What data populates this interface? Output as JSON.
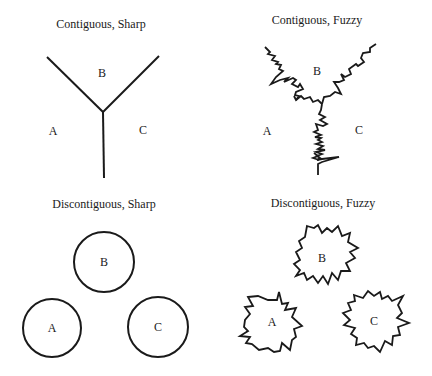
{
  "panels": [
    {
      "id": "contiguous-sharp",
      "title": "Contiguous, Sharp",
      "shape": "sharp Y-shaped boundary lines",
      "regions": [
        {
          "label": "A"
        },
        {
          "label": "B"
        },
        {
          "label": "C"
        }
      ]
    },
    {
      "id": "contiguous-fuzzy",
      "title": "Contiguous, Fuzzy",
      "shape": "jagged Y-shaped boundary lines",
      "regions": [
        {
          "label": "A"
        },
        {
          "label": "B"
        },
        {
          "label": "C"
        }
      ]
    },
    {
      "id": "discontiguous-sharp",
      "title": "Discontiguous, Sharp",
      "shape": "circles",
      "regions": [
        {
          "label": "B"
        },
        {
          "label": "A"
        },
        {
          "label": "C"
        }
      ]
    },
    {
      "id": "discontiguous-fuzzy",
      "title": "Discontiguous, Fuzzy",
      "shape": "jagged star-like blobs",
      "regions": [
        {
          "label": "B"
        },
        {
          "label": "A"
        },
        {
          "label": "C"
        }
      ]
    }
  ],
  "colors": {
    "background": "#ffffff",
    "ink": "#1a1a1a"
  }
}
